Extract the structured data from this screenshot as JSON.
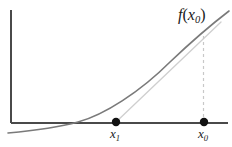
{
  "figure": {
    "kind": "math-diagram",
    "background_color": "#ffffff"
  },
  "labels": {
    "function_value": {
      "text": "f(x₀)",
      "base": "f",
      "arg_open": "(",
      "arg_base": "x",
      "arg_sub": "0",
      "arg_close": ")",
      "x": 178,
      "y": 7,
      "color": "#1a1a1a"
    },
    "x1": {
      "text": "x₁",
      "base": "x",
      "sub": "1",
      "x": 110,
      "y": 127,
      "color": "#1a1a1a"
    },
    "x0": {
      "text": "x₀",
      "base": "x",
      "sub": "0",
      "x": 198,
      "y": 127,
      "color": "#1a1a1a"
    }
  },
  "chart_data": {
    "type": "line",
    "title": "",
    "xlabel": "",
    "ylabel": "",
    "grid": false,
    "legend": "none",
    "axes": {
      "x_axis": {
        "color": "#4a4a4a",
        "width": 1.1,
        "x_start": 11,
        "x_end": 228,
        "y": 123
      },
      "y_axis": {
        "color": "#4a4a4a",
        "width": 1.1,
        "x": 11,
        "y_start": 10,
        "y_end": 123
      }
    },
    "series": [
      {
        "name": "curve",
        "role": "function-curve",
        "color": "#7a7a7a",
        "width": 1.6,
        "path": "M 8 133 C 30 131, 56 128, 78 122 C 104 115, 140 92, 170 62 C 190 43, 212 24, 229 11",
        "points": [
          [
            8,
            133
          ],
          [
            40,
            130
          ],
          [
            78,
            122
          ],
          [
            116,
            106
          ],
          [
            150,
            82
          ],
          [
            180,
            54
          ],
          [
            204,
            35
          ],
          [
            229,
            11
          ]
        ]
      },
      {
        "name": "secant",
        "role": "secant-line",
        "color": "#cfcfcf",
        "width": 1.3,
        "x1": 116,
        "y1": 122,
        "x2": 221,
        "y2": 22
      },
      {
        "name": "dropline",
        "role": "dashed-vertical-at-x0",
        "color": "#c8c8c8",
        "width": 1.2,
        "dash": "3 3",
        "x1": 203.5,
        "y1": 36,
        "x2": 203.5,
        "y2": 122
      }
    ],
    "markers": [
      {
        "name": "x1-point",
        "x": 116,
        "y": 122,
        "r": 4.2,
        "color": "#111111",
        "label": "x₁"
      },
      {
        "name": "x0-point",
        "x": 204,
        "y": 122,
        "r": 4.2,
        "color": "#111111",
        "label": "x₀"
      }
    ]
  }
}
